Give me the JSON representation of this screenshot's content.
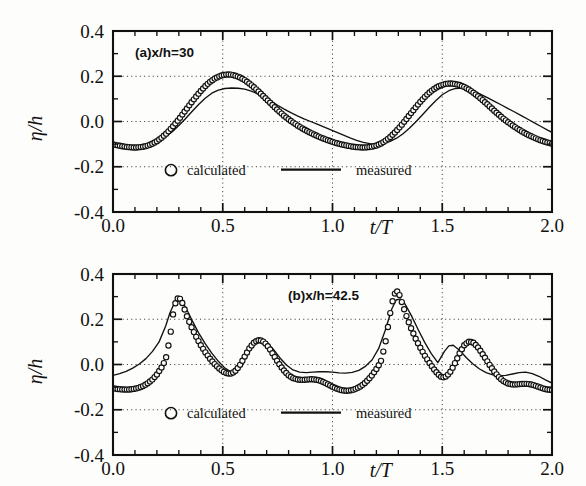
{
  "figure": {
    "background_color": "#fdfdfb",
    "ink_color": "#111111"
  },
  "axes": {
    "x_title": "t/T",
    "y_title": "η/h",
    "x_ticks": [
      "0.0",
      "0.5",
      "1.0",
      "1.5",
      "2.0"
    ],
    "y_ticks": [
      "0.4",
      "0.2",
      "0.0",
      "-0.2",
      "-0.4"
    ],
    "x_tick_values": [
      0.0,
      0.5,
      1.0,
      1.5,
      2.0
    ],
    "y_tick_values": [
      0.4,
      0.2,
      0.0,
      -0.2,
      -0.4
    ],
    "x_minor_per_major": 5,
    "y_minor_per_major": 2,
    "grid_x_values": [
      0.5,
      1.0,
      1.5
    ],
    "grid_y_values": [
      0.2,
      0.0,
      -0.2
    ]
  },
  "legend": {
    "calculated_label": "calculated",
    "measured_label": "measured",
    "calculated_marker": "open-circle",
    "measured_marker": "solid-line"
  },
  "panels": [
    {
      "id": "a",
      "tag": "(a)x/h=30"
    },
    {
      "id": "b",
      "tag": "(b)x/h=42.5"
    }
  ],
  "chart_data": [
    {
      "type": "line",
      "panel": "a",
      "title": "(a)x/h=30",
      "xlabel": "t/T",
      "ylabel": "η/h",
      "xlim": [
        0.0,
        2.0
      ],
      "ylim": [
        -0.4,
        0.4
      ],
      "grid": true,
      "legend_position": "inside-lower-left",
      "series": [
        {
          "name": "calculated",
          "style": "open-circle-markers",
          "x": [
            0.0,
            0.02,
            0.04,
            0.06,
            0.08,
            0.1,
            0.12,
            0.14,
            0.16,
            0.18,
            0.2,
            0.22,
            0.24,
            0.26,
            0.28,
            0.3,
            0.32,
            0.34,
            0.36,
            0.38,
            0.4,
            0.42,
            0.44,
            0.46,
            0.48,
            0.5,
            0.52,
            0.54,
            0.56,
            0.58,
            0.6,
            0.62,
            0.64,
            0.66,
            0.68,
            0.7,
            0.72,
            0.74,
            0.76,
            0.78,
            0.8,
            0.82,
            0.84,
            0.86,
            0.88,
            0.9,
            0.92,
            0.94,
            0.96,
            0.98,
            1.0,
            1.02,
            1.04,
            1.06,
            1.08,
            1.1,
            1.12,
            1.14,
            1.16,
            1.18,
            1.2,
            1.22,
            1.24,
            1.26,
            1.28,
            1.3,
            1.32,
            1.34,
            1.36,
            1.38,
            1.4,
            1.42,
            1.44,
            1.46,
            1.48,
            1.5,
            1.52,
            1.54,
            1.56,
            1.58,
            1.6,
            1.62,
            1.64,
            1.66,
            1.68,
            1.7,
            1.72,
            1.74,
            1.76,
            1.78,
            1.8,
            1.82,
            1.84,
            1.86,
            1.88,
            1.9,
            1.92,
            1.94,
            1.96,
            1.98,
            2.0
          ],
          "y": [
            -0.101,
            -0.105,
            -0.109,
            -0.112,
            -0.114,
            -0.115,
            -0.114,
            -0.111,
            -0.106,
            -0.098,
            -0.087,
            -0.073,
            -0.056,
            -0.036,
            -0.014,
            0.01,
            0.036,
            0.062,
            0.088,
            0.112,
            0.135,
            0.156,
            0.174,
            0.188,
            0.198,
            0.205,
            0.208,
            0.207,
            0.202,
            0.194,
            0.183,
            0.169,
            0.153,
            0.136,
            0.117,
            0.098,
            0.079,
            0.06,
            0.042,
            0.025,
            0.01,
            -0.004,
            -0.017,
            -0.029,
            -0.04,
            -0.05,
            -0.059,
            -0.068,
            -0.076,
            -0.083,
            -0.09,
            -0.096,
            -0.101,
            -0.105,
            -0.109,
            -0.112,
            -0.114,
            -0.115,
            -0.114,
            -0.111,
            -0.106,
            -0.098,
            -0.086,
            -0.071,
            -0.053,
            -0.032,
            -0.009,
            0.015,
            0.04,
            0.064,
            0.087,
            0.108,
            0.127,
            0.142,
            0.154,
            0.162,
            0.167,
            0.168,
            0.166,
            0.161,
            0.153,
            0.142,
            0.129,
            0.114,
            0.098,
            0.081,
            0.063,
            0.045,
            0.028,
            0.012,
            -0.003,
            -0.017,
            -0.03,
            -0.042,
            -0.053,
            -0.063,
            -0.072,
            -0.08,
            -0.087,
            -0.093,
            -0.098
          ]
        },
        {
          "name": "measured",
          "style": "thin-solid-line",
          "x": [
            0.0,
            0.03,
            0.06,
            0.09,
            0.12,
            0.15,
            0.18,
            0.21,
            0.24,
            0.27,
            0.3,
            0.33,
            0.36,
            0.39,
            0.42,
            0.45,
            0.48,
            0.51,
            0.54,
            0.57,
            0.6,
            0.63,
            0.66,
            0.69,
            0.72,
            0.75,
            0.78,
            0.81,
            0.84,
            0.87,
            0.9,
            0.93,
            0.96,
            0.99,
            1.02,
            1.05,
            1.08,
            1.11,
            1.14,
            1.17,
            1.2,
            1.23,
            1.26,
            1.29,
            1.32,
            1.35,
            1.38,
            1.41,
            1.44,
            1.47,
            1.5,
            1.53,
            1.56,
            1.59,
            1.62,
            1.65,
            1.68,
            1.71,
            1.74,
            1.77,
            1.8,
            1.83,
            1.86,
            1.89,
            1.92,
            1.95,
            1.98,
            2.0
          ],
          "y": [
            -0.096,
            -0.103,
            -0.107,
            -0.109,
            -0.108,
            -0.104,
            -0.096,
            -0.084,
            -0.067,
            -0.045,
            -0.018,
            0.012,
            0.044,
            0.075,
            0.103,
            0.125,
            0.139,
            0.146,
            0.148,
            0.147,
            0.143,
            0.134,
            0.122,
            0.107,
            0.09,
            0.072,
            0.055,
            0.039,
            0.025,
            0.012,
            0.0,
            -0.012,
            -0.024,
            -0.036,
            -0.048,
            -0.06,
            -0.072,
            -0.083,
            -0.092,
            -0.098,
            -0.1,
            -0.097,
            -0.089,
            -0.075,
            -0.055,
            -0.03,
            -0.001,
            0.03,
            0.062,
            0.092,
            0.118,
            0.136,
            0.146,
            0.148,
            0.143,
            0.132,
            0.118,
            0.103,
            0.088,
            0.073,
            0.057,
            0.042,
            0.026,
            0.01,
            -0.006,
            -0.022,
            -0.038,
            -0.048
          ]
        }
      ]
    },
    {
      "type": "line",
      "panel": "b",
      "title": "(b)x/h=42.5",
      "xlabel": "t/T",
      "ylabel": "η/h",
      "xlim": [
        0.0,
        2.0
      ],
      "ylim": [
        -0.4,
        0.4
      ],
      "grid": true,
      "legend_position": "inside-lower-left",
      "series": [
        {
          "name": "calculated",
          "style": "open-circle-markers",
          "x": [
            0.0,
            0.02,
            0.04,
            0.06,
            0.08,
            0.1,
            0.12,
            0.14,
            0.16,
            0.18,
            0.2,
            0.22,
            0.24,
            0.26,
            0.27,
            0.28,
            0.29,
            0.3,
            0.31,
            0.32,
            0.33,
            0.34,
            0.36,
            0.38,
            0.4,
            0.42,
            0.44,
            0.46,
            0.48,
            0.5,
            0.52,
            0.54,
            0.56,
            0.58,
            0.6,
            0.62,
            0.64,
            0.66,
            0.68,
            0.7,
            0.72,
            0.74,
            0.76,
            0.78,
            0.8,
            0.82,
            0.84,
            0.86,
            0.88,
            0.9,
            0.92,
            0.94,
            0.96,
            0.98,
            1.0,
            1.02,
            1.04,
            1.06,
            1.08,
            1.1,
            1.12,
            1.14,
            1.16,
            1.18,
            1.2,
            1.22,
            1.24,
            1.25,
            1.26,
            1.27,
            1.28,
            1.29,
            1.3,
            1.31,
            1.32,
            1.34,
            1.36,
            1.38,
            1.4,
            1.42,
            1.44,
            1.46,
            1.48,
            1.5,
            1.52,
            1.54,
            1.56,
            1.58,
            1.6,
            1.62,
            1.64,
            1.66,
            1.68,
            1.7,
            1.72,
            1.74,
            1.76,
            1.78,
            1.8,
            1.82,
            1.84,
            1.86,
            1.88,
            1.9,
            1.92,
            1.94,
            1.96,
            1.98,
            2.0
          ],
          "y": [
            -0.105,
            -0.108,
            -0.11,
            -0.111,
            -0.11,
            -0.107,
            -0.102,
            -0.094,
            -0.082,
            -0.066,
            -0.044,
            -0.015,
            0.022,
            0.12,
            0.2,
            0.258,
            0.288,
            0.296,
            0.285,
            0.262,
            0.232,
            0.205,
            0.16,
            0.12,
            0.085,
            0.055,
            0.028,
            0.005,
            -0.014,
            -0.03,
            -0.04,
            -0.04,
            -0.026,
            0.0,
            0.035,
            0.07,
            0.095,
            0.108,
            0.105,
            0.088,
            0.06,
            0.028,
            -0.002,
            -0.028,
            -0.048,
            -0.06,
            -0.066,
            -0.068,
            -0.067,
            -0.065,
            -0.066,
            -0.07,
            -0.078,
            -0.088,
            -0.098,
            -0.107,
            -0.113,
            -0.116,
            -0.115,
            -0.11,
            -0.101,
            -0.088,
            -0.07,
            -0.047,
            -0.02,
            0.012,
            0.09,
            0.15,
            0.21,
            0.265,
            0.305,
            0.325,
            0.32,
            0.295,
            0.262,
            0.205,
            0.155,
            0.112,
            0.074,
            0.04,
            0.01,
            -0.018,
            -0.042,
            -0.058,
            -0.052,
            -0.028,
            0.01,
            0.052,
            0.085,
            0.101,
            0.098,
            0.08,
            0.052,
            0.022,
            -0.008,
            -0.035,
            -0.058,
            -0.074,
            -0.084,
            -0.088,
            -0.088,
            -0.086,
            -0.085,
            -0.087,
            -0.092,
            -0.099,
            -0.106,
            -0.111,
            -0.113,
            -0.112
          ]
        },
        {
          "name": "measured",
          "style": "thin-solid-line",
          "x": [
            0.0,
            0.03,
            0.06,
            0.09,
            0.12,
            0.15,
            0.18,
            0.21,
            0.24,
            0.26,
            0.28,
            0.3,
            0.32,
            0.34,
            0.36,
            0.39,
            0.42,
            0.45,
            0.48,
            0.51,
            0.54,
            0.56,
            0.58,
            0.61,
            0.64,
            0.67,
            0.7,
            0.73,
            0.76,
            0.79,
            0.82,
            0.85,
            0.88,
            0.91,
            0.94,
            0.97,
            1.0,
            1.03,
            1.06,
            1.09,
            1.12,
            1.15,
            1.18,
            1.21,
            1.24,
            1.27,
            1.29,
            1.31,
            1.33,
            1.36,
            1.39,
            1.42,
            1.45,
            1.48,
            1.51,
            1.53,
            1.55,
            1.58,
            1.61,
            1.64,
            1.67,
            1.7,
            1.73,
            1.76,
            1.79,
            1.82,
            1.85,
            1.88,
            1.91,
            1.94,
            1.97,
            2.0
          ],
          "y": [
            -0.048,
            -0.04,
            -0.03,
            -0.016,
            0.002,
            0.026,
            0.058,
            0.1,
            0.17,
            0.23,
            0.272,
            0.288,
            0.27,
            0.235,
            0.195,
            0.14,
            0.092,
            0.05,
            0.014,
            -0.016,
            -0.035,
            -0.03,
            -0.006,
            0.04,
            0.085,
            0.108,
            0.1,
            0.068,
            0.03,
            -0.002,
            -0.024,
            -0.034,
            -0.036,
            -0.034,
            -0.032,
            -0.032,
            -0.034,
            -0.037,
            -0.038,
            -0.035,
            -0.026,
            -0.008,
            0.02,
            0.07,
            0.15,
            0.245,
            0.285,
            0.29,
            0.268,
            0.215,
            0.155,
            0.098,
            0.048,
            0.008,
            0.058,
            0.082,
            0.085,
            0.062,
            0.03,
            0.002,
            -0.02,
            -0.036,
            -0.046,
            -0.05,
            -0.048,
            -0.042,
            -0.036,
            -0.034,
            -0.04,
            -0.052,
            -0.068,
            -0.082
          ]
        }
      ]
    }
  ]
}
